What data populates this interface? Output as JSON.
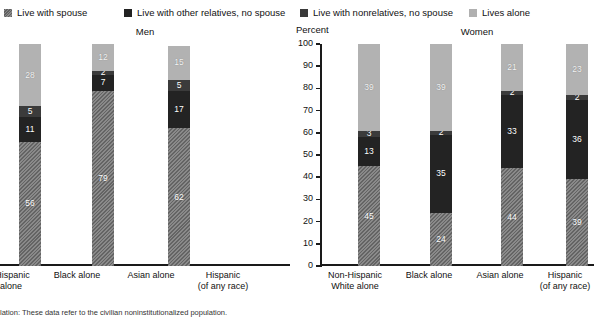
{
  "legend": {
    "items": [
      {
        "label": "Live with spouse",
        "icon": "legend-swatch-hatched",
        "color": "#8a8a8a",
        "key": "spouse"
      },
      {
        "label": "Live with other relatives, no spouse",
        "icon": "legend-swatch-solid",
        "color": "#232323",
        "key": "relatives"
      },
      {
        "label": "Live with nonrelatives, no spouse",
        "icon": "legend-swatch-solid",
        "color": "#3b3b3b",
        "key": "nonrelatives"
      },
      {
        "label": "Lives alone",
        "icon": "legend-swatch-solid",
        "color": "#b2b2b2",
        "key": "alone"
      }
    ]
  },
  "footnote": "lation: These data refer to the civilian noninstitutionalized population.",
  "chart_data": [
    {
      "type": "bar",
      "title": "Men",
      "stacked": true,
      "truncated_left": true,
      "xlabel": "",
      "ylabel": "",
      "ylim": [
        0,
        100
      ],
      "grid": false,
      "legend_position": "top",
      "series": [
        {
          "name": "Live with spouse",
          "color": "#8a8a8a",
          "values": [
            54,
            56,
            79,
            62
          ]
        },
        {
          "name": "Live with other relatives, no spouse",
          "color": "#232323",
          "values": [
            8,
            11,
            7,
            17
          ]
        },
        {
          "name": "Live with nonrelatives, no spouse",
          "color": "#3b3b3b",
          "values": [
            5,
            5,
            2,
            5
          ]
        },
        {
          "name": "Lives alone",
          "color": "#b2b2b2",
          "values": [
            19,
            28,
            12,
            15
          ]
        }
      ],
      "categories": [
        "-Hispanic\nalone",
        "Black alone",
        "Asian alone",
        "Hispanic\n(of any race)"
      ],
      "yticks": [
        0,
        10,
        20,
        30,
        40,
        50,
        60,
        70,
        80,
        90,
        100
      ]
    },
    {
      "type": "bar",
      "title": "Women",
      "stacked": true,
      "truncated_left": false,
      "xlabel": "",
      "ylabel": "Percent",
      "ylim": [
        0,
        100
      ],
      "grid": false,
      "legend_position": "top",
      "series": [
        {
          "name": "Live with spouse",
          "color": "#8a8a8a",
          "values": [
            45,
            24,
            44,
            39
          ]
        },
        {
          "name": "Live with other relatives, no spouse",
          "color": "#232323",
          "values": [
            13,
            35,
            33,
            36
          ]
        },
        {
          "name": "Live with nonrelatives, no spouse",
          "color": "#3b3b3b",
          "values": [
            3,
            2,
            2,
            2
          ]
        },
        {
          "name": "Lives alone",
          "color": "#b2b2b2",
          "values": [
            39,
            39,
            21,
            23
          ]
        }
      ],
      "categories": [
        "Non-Hispanic\nWhite alone",
        "Black alone",
        "Asian alone",
        "Hispanic\n(of any race)"
      ],
      "yticks": [
        0,
        10,
        20,
        30,
        40,
        50,
        60,
        70,
        80,
        90,
        100
      ]
    }
  ]
}
